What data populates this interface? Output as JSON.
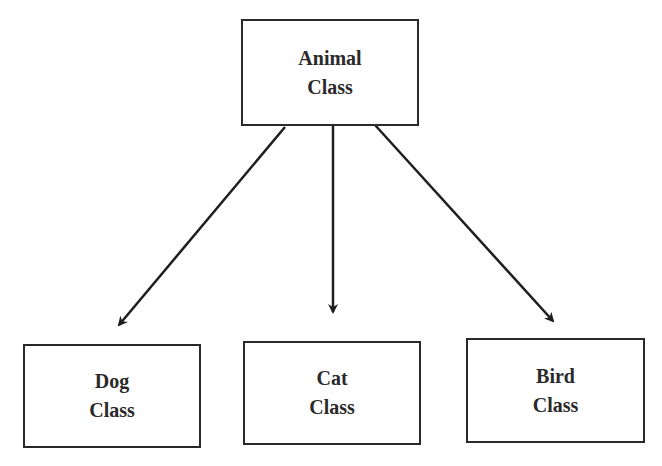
{
  "diagram": {
    "type": "class-hierarchy",
    "nodes": [
      {
        "id": "animal",
        "line1": "Animal",
        "line2": "Class"
      },
      {
        "id": "dog",
        "line1": "Dog",
        "line2": "Class"
      },
      {
        "id": "cat",
        "line1": "Cat",
        "line2": "Class"
      },
      {
        "id": "bird",
        "line1": "Bird",
        "line2": "Class"
      }
    ],
    "edges": [
      {
        "from": "animal",
        "to": "dog"
      },
      {
        "from": "animal",
        "to": "cat"
      },
      {
        "from": "animal",
        "to": "bird"
      }
    ],
    "colors": {
      "stroke": "#2a2a2a",
      "background": "#ffffff"
    }
  }
}
